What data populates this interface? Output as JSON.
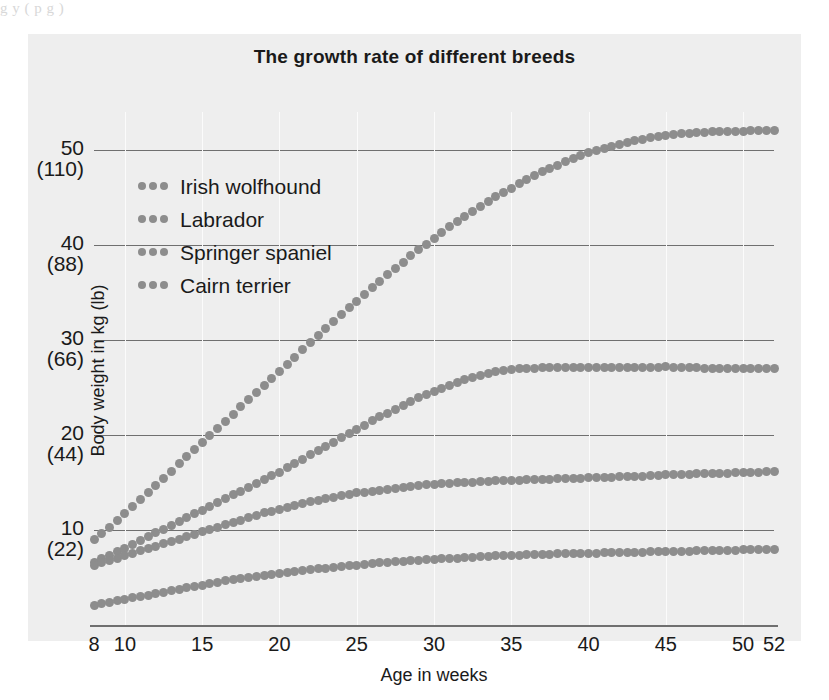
{
  "artifact_text": "g                                             y            ( p g      )",
  "figure": {
    "title": "The growth rate of different breeds",
    "background_color": "#eeeeee",
    "marker_color": "#8d8d8d"
  },
  "legend": {
    "position": "upper-left-inside",
    "items": [
      {
        "label": "Irish wolfhound",
        "marker": "dotted-line-swatch"
      },
      {
        "label": "Labrador",
        "marker": "dotted-line-swatch"
      },
      {
        "label": "Springer spaniel",
        "marker": "dotted-line-swatch"
      },
      {
        "label": "Cairn terrier",
        "marker": "dotted-line-swatch"
      }
    ]
  },
  "axes": {
    "x": {
      "label": "Age in weeks",
      "ticks": [
        "8",
        "10",
        "15",
        "20",
        "25",
        "30",
        "35",
        "40",
        "45",
        "50",
        "52"
      ],
      "tick_values": [
        8,
        10,
        15,
        20,
        25,
        30,
        35,
        40,
        45,
        50,
        52
      ],
      "range": [
        8,
        52
      ]
    },
    "y": {
      "label": "Body weight in kg (lb)",
      "ticks": [
        {
          "kg": "50",
          "lb": "(110)"
        },
        {
          "kg": "40",
          "lb": "(88)"
        },
        {
          "kg": "30",
          "lb": "(66)"
        },
        {
          "kg": "20",
          "lb": "(44)"
        },
        {
          "kg": "10",
          "lb": "(22)"
        }
      ],
      "tick_values": [
        50,
        40,
        30,
        20,
        10
      ],
      "range": [
        0,
        54
      ],
      "gridlines": true
    }
  },
  "chart_data": {
    "type": "line",
    "title": "The growth rate of different breeds",
    "xlabel": "Age in weeks",
    "ylabel": "Body weight in kg (lb)",
    "xlim": [
      8,
      52
    ],
    "ylim": [
      0,
      54
    ],
    "grid": true,
    "legend_position": "upper left",
    "marker_style": "dotted",
    "x": [
      8,
      9,
      10,
      11,
      12,
      13,
      14,
      15,
      16,
      17,
      18,
      19,
      20,
      21,
      22,
      23,
      24,
      25,
      26,
      27,
      28,
      29,
      30,
      31,
      32,
      33,
      34,
      35,
      36,
      37,
      38,
      39,
      40,
      41,
      42,
      43,
      44,
      45,
      46,
      47,
      48,
      49,
      50,
      51,
      52
    ],
    "series": [
      {
        "name": "Irish wolfhound",
        "color": "#8d8d8d",
        "values": [
          9.0,
          10.3,
          11.7,
          13.2,
          14.7,
          16.2,
          17.7,
          19.2,
          20.7,
          22.2,
          23.7,
          25.2,
          26.7,
          28.2,
          29.7,
          31.2,
          32.7,
          34.1,
          35.5,
          36.9,
          38.2,
          39.5,
          40.7,
          41.9,
          43.0,
          44.1,
          45.1,
          46.0,
          46.9,
          47.7,
          48.4,
          49.1,
          49.7,
          50.2,
          50.6,
          51.0,
          51.3,
          51.5,
          51.7,
          51.8,
          51.9,
          52.0,
          52.0,
          52.1,
          52.1
        ]
      },
      {
        "name": "Labrador",
        "color": "#8d8d8d",
        "values": [
          6.6,
          7.3,
          8.1,
          8.9,
          9.7,
          10.5,
          11.3,
          12.1,
          12.9,
          13.7,
          14.5,
          15.3,
          16.1,
          17.0,
          17.9,
          18.8,
          19.7,
          20.6,
          21.5,
          22.3,
          23.1,
          23.9,
          24.6,
          25.2,
          25.8,
          26.3,
          26.7,
          26.9,
          27.0,
          27.1,
          27.1,
          27.1,
          27.1,
          27.1,
          27.1,
          27.1,
          27.1,
          27.2,
          27.1,
          27.1,
          27.0,
          27.0,
          27.0,
          27.0,
          27.0
        ]
      },
      {
        "name": "Springer spaniel",
        "color": "#8d8d8d",
        "values": [
          6.3,
          6.8,
          7.3,
          7.8,
          8.3,
          8.8,
          9.3,
          9.8,
          10.3,
          10.8,
          11.3,
          11.8,
          12.2,
          12.6,
          13.0,
          13.3,
          13.6,
          13.9,
          14.1,
          14.3,
          14.5,
          14.7,
          14.8,
          14.9,
          15.0,
          15.1,
          15.2,
          15.2,
          15.3,
          15.3,
          15.4,
          15.4,
          15.5,
          15.5,
          15.6,
          15.6,
          15.7,
          15.8,
          15.8,
          15.9,
          16.0,
          16.0,
          16.1,
          16.1,
          16.2
        ]
      },
      {
        "name": "Cairn terrier",
        "color": "#8d8d8d",
        "values": [
          2.1,
          2.4,
          2.7,
          3.0,
          3.3,
          3.6,
          3.9,
          4.2,
          4.5,
          4.8,
          5.0,
          5.2,
          5.4,
          5.6,
          5.8,
          6.0,
          6.2,
          6.3,
          6.5,
          6.6,
          6.7,
          6.8,
          6.9,
          7.0,
          7.1,
          7.2,
          7.3,
          7.3,
          7.4,
          7.4,
          7.5,
          7.5,
          7.5,
          7.6,
          7.6,
          7.6,
          7.7,
          7.7,
          7.7,
          7.8,
          7.8,
          7.8,
          7.9,
          7.9,
          7.9
        ]
      }
    ]
  }
}
